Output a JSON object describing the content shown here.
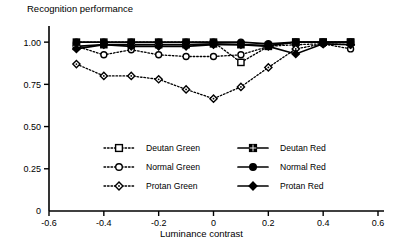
{
  "chart_data": {
    "type": "line",
    "title": "",
    "ylabel": "Recognition performance",
    "xlabel": "Luminance contrast",
    "xlim": [
      -0.6,
      0.6
    ],
    "ylim": [
      0,
      1.06
    ],
    "grid": false,
    "legend_position": "inside-lower-center",
    "xticklabels": [
      "-0.6",
      "-0.4",
      "-0.2",
      "0",
      "0.2",
      "0.4",
      "0.6"
    ],
    "xtickvalues": [
      -0.6,
      -0.4,
      -0.2,
      0,
      0.2,
      0.4,
      0.6
    ],
    "yticklabels": [
      "0",
      "0.25",
      "0.50",
      "0.75",
      "1.00"
    ],
    "ytickvalues": [
      0,
      0.25,
      0.5,
      0.75,
      1.0
    ],
    "x": [
      -0.5,
      -0.4,
      -0.3,
      -0.2,
      -0.1,
      0,
      0.1,
      0.2,
      0.3,
      0.4,
      0.5
    ],
    "series": [
      {
        "name": "Deutan Green",
        "marker": "open-square",
        "line": "dotted",
        "color": "#000000",
        "values": [
          1.0,
          1.0,
          1.0,
          1.0,
          1.0,
          1.0,
          0.88,
          0.975,
          1.0,
          1.0,
          1.0
        ]
      },
      {
        "name": "Normal Green",
        "marker": "open-circle",
        "line": "dotted",
        "color": "#000000",
        "values": [
          0.975,
          0.925,
          0.955,
          0.925,
          0.915,
          0.915,
          0.925,
          0.975,
          0.985,
          0.99,
          0.96
        ]
      },
      {
        "name": "Protan Green",
        "marker": "open-diamond",
        "line": "dotted",
        "color": "#000000",
        "values": [
          0.87,
          0.8,
          0.8,
          0.78,
          0.72,
          0.665,
          0.735,
          0.85,
          0.96,
          0.99,
          0.985
        ]
      },
      {
        "name": "Deutan Red",
        "marker": "filled-square",
        "line": "solid",
        "color": "#000000",
        "values": [
          0.975,
          0.985,
          0.985,
          0.985,
          0.985,
          0.99,
          0.985,
          0.98,
          1.0,
          1.0,
          1.0
        ]
      },
      {
        "name": "Normal Red",
        "marker": "filled-circle",
        "line": "solid",
        "color": "#000000",
        "values": [
          1.0,
          1.0,
          1.0,
          1.0,
          1.0,
          1.0,
          1.0,
          0.99,
          1.0,
          1.0,
          1.0
        ]
      },
      {
        "name": "Protan Red",
        "marker": "filled-diamond",
        "line": "solid",
        "color": "#000000",
        "values": [
          0.96,
          0.985,
          0.975,
          0.975,
          0.975,
          0.985,
          0.985,
          0.975,
          0.93,
          0.99,
          0.985
        ]
      }
    ],
    "legend": [
      {
        "label": "Deutan Green",
        "marker": "open-square",
        "line": "dotted"
      },
      {
        "label": "Deutan Red",
        "marker": "filled-square",
        "line": "solid"
      },
      {
        "label": "Normal Green",
        "marker": "open-circle",
        "line": "dotted"
      },
      {
        "label": "Normal Red",
        "marker": "filled-circle",
        "line": "solid"
      },
      {
        "label": "Protan Green",
        "marker": "open-diamond",
        "line": "dotted"
      },
      {
        "label": "Protan Red",
        "marker": "filled-diamond",
        "line": "solid"
      }
    ]
  }
}
